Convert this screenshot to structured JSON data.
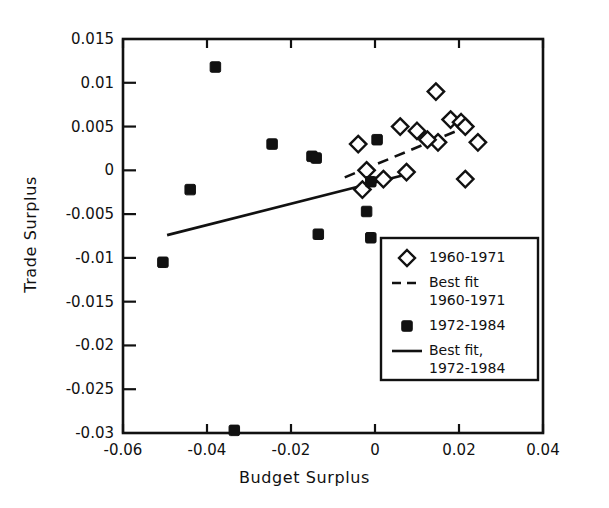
{
  "chart_data": {
    "type": "scatter",
    "title": "",
    "xlabel": "Budget Surplus",
    "ylabel": "Trade Surplus",
    "xlim": [
      -0.06,
      0.04
    ],
    "ylim": [
      -0.03,
      0.015
    ],
    "xticks": [
      -0.06,
      -0.04,
      -0.02,
      0,
      0.02,
      0.04
    ],
    "xtick_labels": [
      "-0.06",
      "-0.04",
      "-0.02",
      "0",
      "0.02",
      "0.04"
    ],
    "yticks": [
      0.015,
      0.01,
      0.005,
      0,
      -0.005,
      -0.01,
      -0.015,
      -0.02,
      -0.025,
      -0.03
    ],
    "ytick_labels": [
      "0.015",
      "0.01",
      "0.005",
      "0",
      "-0.005",
      "-0.01",
      "-0.015",
      "-0.02",
      "-0.025",
      "-0.03"
    ],
    "grid": false,
    "legend_position": "lower right",
    "series": [
      {
        "name": "1960-1971",
        "marker": "open-diamond",
        "color": "#111111",
        "points": [
          [
            0.0145,
            0.009
          ],
          [
            0.006,
            0.005
          ],
          [
            0.018,
            0.0058
          ],
          [
            0.0205,
            0.0055
          ],
          [
            0.0215,
            0.005
          ],
          [
            0.01,
            0.0045
          ],
          [
            0.015,
            0.0032
          ],
          [
            0.0245,
            0.0032
          ],
          [
            0.0125,
            0.0035
          ],
          [
            -0.004,
            0.003
          ],
          [
            0.0075,
            -0.0002
          ],
          [
            -0.002,
            0.0
          ],
          [
            -0.003,
            -0.0022
          ],
          [
            0.002,
            -0.001
          ],
          [
            0.0215,
            -0.001
          ]
        ]
      },
      {
        "name": "1972-1984",
        "marker": "filled-square",
        "color": "#111111",
        "points": [
          [
            -0.038,
            0.0118
          ],
          [
            -0.0245,
            0.003
          ],
          [
            -0.015,
            0.0016
          ],
          [
            -0.014,
            0.0014
          ],
          [
            0.0005,
            0.0035
          ],
          [
            -0.044,
            -0.0022
          ],
          [
            -0.001,
            -0.0013
          ],
          [
            -0.002,
            -0.0047
          ],
          [
            -0.0135,
            -0.0073
          ],
          [
            -0.001,
            -0.0077
          ],
          [
            -0.0505,
            -0.0105
          ],
          [
            -0.0335,
            -0.0297
          ]
        ]
      }
    ],
    "fits": [
      {
        "name": "Best fit 1960-1971",
        "style": "dashed",
        "color": "#111111",
        "x0": -0.0072,
        "y0": -0.0008,
        "x1": 0.0235,
        "y1": 0.0053
      },
      {
        "name": "Best fit, 1972-1984",
        "style": "solid",
        "color": "#111111",
        "x0": -0.0495,
        "y0": -0.0074,
        "x1": 0.0065,
        "y1": -0.0006
      }
    ]
  },
  "legend": {
    "entries": [
      {
        "label": "1960-1971",
        "marker": "open-diamond"
      },
      {
        "label": "Best fit",
        "label2": "1960-1971",
        "marker": "dashed-line"
      },
      {
        "label": "1972-1984",
        "marker": "filled-square"
      },
      {
        "label": "Best fit,",
        "label2": "1972-1984",
        "marker": "solid-line"
      }
    ]
  }
}
